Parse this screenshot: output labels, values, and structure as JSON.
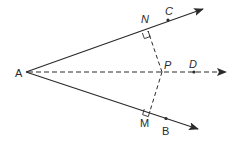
{
  "diagram": {
    "type": "geometry-angle-bisector",
    "colors": {
      "line": "#2a2a2a",
      "background": "#ffffff"
    },
    "points": {
      "A": {
        "label": "A",
        "x": 26,
        "y": 72
      },
      "N": {
        "label": "N",
        "x": 148,
        "y": 31
      },
      "C": {
        "label": "C",
        "x": 168,
        "y": 20
      },
      "M": {
        "label": "M",
        "x": 150,
        "y": 111
      },
      "B": {
        "label": "B",
        "x": 166,
        "y": 118
      },
      "P": {
        "label": "P",
        "x": 162,
        "y": 72
      },
      "D": {
        "label": "D",
        "x": 194,
        "y": 72
      }
    },
    "rays": [
      {
        "name": "ray-AC",
        "from": "A",
        "through": "C",
        "style": "solid",
        "arrow": true
      },
      {
        "name": "ray-AB",
        "from": "A",
        "through": "B",
        "style": "solid",
        "arrow": true
      },
      {
        "name": "ray-AD",
        "from": "A",
        "through": "D",
        "style": "dashed",
        "arrow": true
      }
    ],
    "segments": [
      {
        "name": "segment-PN",
        "from": "P",
        "to": "N",
        "style": "dashed"
      },
      {
        "name": "segment-PM",
        "from": "P",
        "to": "M",
        "style": "dashed"
      }
    ],
    "right_angles": [
      "N",
      "M"
    ]
  }
}
